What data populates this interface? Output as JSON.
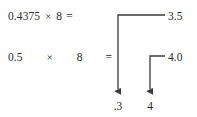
{
  "diagram": {
    "background_color": "#ffffff",
    "ink_color": "#2b2b2b",
    "line_color": "#3a3a3a"
  },
  "equations": [
    {
      "id": "row-1",
      "operand": "0.4375",
      "times_symbol": "×",
      "multiplier": "8",
      "equals": "=",
      "result": "3.5",
      "extracted_digit": ".3"
    },
    {
      "id": "row-2",
      "operand": "0.5",
      "times_symbol": "×",
      "multiplier": "8",
      "equals": "=",
      "result": "4.0",
      "extracted_digit": "4"
    }
  ],
  "connectors": [
    {
      "name": "connector-from-3.5-to-.3",
      "start_x": 165,
      "start_y": 15,
      "corner_x": 118,
      "corner_y": 15,
      "end_x": 118,
      "end_y": 96,
      "arrowhead": "down"
    },
    {
      "name": "connector-from-4.0-to-4",
      "start_x": 165,
      "start_y": 56,
      "corner_x": 150,
      "corner_y": 56,
      "end_x": 150,
      "end_y": 96,
      "arrowhead": "down"
    }
  ]
}
